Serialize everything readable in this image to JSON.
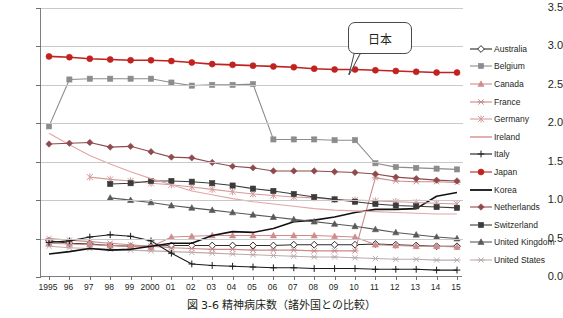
{
  "caption": "図 3-6  精神病床数（諸外国との比較）",
  "annotation": {
    "label": "日本"
  },
  "axis": {
    "y_ticks": [
      "0.0",
      "0.5",
      "1.0",
      "1.5",
      "2.0",
      "2.5",
      "3.0",
      "3.5"
    ],
    "x_ticks": [
      "1995",
      "96",
      "97",
      "98",
      "99",
      "2000",
      "01",
      "02",
      "03",
      "04",
      "05",
      "06",
      "07",
      "08",
      "09",
      "10",
      "11",
      "12",
      "13",
      "14",
      "15"
    ]
  },
  "legend": {
    "position": "right",
    "items": [
      {
        "label": "Australia",
        "color": "#2b2b2b",
        "marker": "diamond-open",
        "fill": "#ffffff"
      },
      {
        "label": "Belgium",
        "color": "#8c8c8c",
        "marker": "square",
        "fill": "#8c8c8c"
      },
      {
        "label": "Canada",
        "color": "#d08c8c",
        "marker": "triangle",
        "fill": "#d08c8c"
      },
      {
        "label": "France",
        "color": "#c98b8b",
        "marker": "x-bar",
        "fill": "#c98b8b"
      },
      {
        "label": "Germany",
        "color": "#d59a9a",
        "marker": "asterisk",
        "fill": "#d59a9a"
      },
      {
        "label": "Ireland",
        "color": "#e0a7a7",
        "marker": "none",
        "fill": "#e0a7a7"
      },
      {
        "label": "Italy",
        "color": "#1a1a1a",
        "marker": "plus",
        "fill": "#1a1a1a"
      },
      {
        "label": "Japan",
        "color": "#c0221f",
        "marker": "circle",
        "fill": "#c0221f"
      },
      {
        "label": "Korea",
        "color": "#111111",
        "marker": "none",
        "fill": "#111111"
      },
      {
        "label": "Netherlands",
        "color": "#8e4a4f",
        "marker": "diamond",
        "fill": "#8e4a4f"
      },
      {
        "label": "Switzerland",
        "color": "#3b3b3b",
        "marker": "square",
        "fill": "#3b3b3b"
      },
      {
        "label": "United Kingdom",
        "color": "#595959",
        "marker": "triangle",
        "fill": "#595959"
      },
      {
        "label": "United States",
        "color": "#bdaaaa",
        "marker": "x-bar",
        "fill": "#bdaaaa"
      }
    ]
  },
  "chart_data": {
    "type": "line",
    "title": "図 3-6  精神病床数（諸外国との比較）",
    "xlabel": "",
    "ylabel": "",
    "ylim": [
      0.0,
      3.5
    ],
    "grid": true,
    "legend_position": "right",
    "annotations": [
      {
        "text": "日本",
        "series": "Japan",
        "x": "09"
      }
    ],
    "x": [
      "1995",
      "96",
      "97",
      "98",
      "99",
      "2000",
      "01",
      "02",
      "03",
      "04",
      "05",
      "06",
      "07",
      "08",
      "09",
      "10",
      "11",
      "12",
      "13",
      "14",
      "15"
    ],
    "series": [
      {
        "name": "Japan",
        "color": "#c0221f",
        "values": [
          2.87,
          2.86,
          2.84,
          2.83,
          2.82,
          2.82,
          2.81,
          2.79,
          2.77,
          2.76,
          2.75,
          2.74,
          2.73,
          2.71,
          2.7,
          2.7,
          2.69,
          2.68,
          2.67,
          2.66,
          2.66
        ]
      },
      {
        "name": "Belgium",
        "color": "#8c8c8c",
        "values": [
          1.96,
          2.57,
          2.58,
          2.58,
          2.58,
          2.58,
          2.53,
          2.49,
          2.5,
          2.5,
          2.51,
          1.79,
          1.79,
          1.79,
          1.78,
          1.78,
          1.48,
          1.43,
          1.42,
          1.41,
          1.4
        ]
      },
      {
        "name": "Netherlands",
        "color": "#8e4a4f",
        "values": [
          1.73,
          1.74,
          1.75,
          1.69,
          1.7,
          1.63,
          1.56,
          1.55,
          1.49,
          1.44,
          1.42,
          1.38,
          1.38,
          1.38,
          1.37,
          1.36,
          1.34,
          1.3,
          1.28,
          1.26,
          1.25
        ]
      },
      {
        "name": "Ireland",
        "color": "#e0a7a7",
        "values": [
          1.87,
          1.72,
          1.58,
          1.47,
          1.37,
          1.28,
          1.2,
          1.12,
          1.07,
          1.02,
          0.98,
          0.95,
          0.92,
          0.89,
          0.87,
          0.86,
          0.85,
          0.84,
          0.83,
          0.82,
          0.82
        ]
      },
      {
        "name": "Switzerland",
        "color": "#3b3b3b",
        "values": [
          null,
          null,
          null,
          1.21,
          1.22,
          1.25,
          1.25,
          1.24,
          1.22,
          1.19,
          1.15,
          1.12,
          1.08,
          1.04,
          1.01,
          0.98,
          0.95,
          0.93,
          0.92,
          0.91,
          0.9
        ]
      },
      {
        "name": "Germany",
        "color": "#d59a9a",
        "values": [
          null,
          null,
          1.3,
          1.27,
          1.25,
          1.22,
          1.2,
          1.17,
          1.14,
          1.11,
          1.08,
          1.06,
          1.04,
          1.03,
          1.01,
          1.0,
          0.99,
          0.98,
          0.97,
          0.96,
          0.95
        ]
      },
      {
        "name": "United Kingdom",
        "color": "#595959",
        "values": [
          null,
          null,
          null,
          1.03,
          1.0,
          0.97,
          0.93,
          0.9,
          0.87,
          0.84,
          0.81,
          0.78,
          0.75,
          0.72,
          0.69,
          0.66,
          0.62,
          0.58,
          0.55,
          0.52,
          0.5
        ]
      },
      {
        "name": "Korea",
        "color": "#111111",
        "values": [
          0.3,
          0.33,
          0.37,
          0.35,
          0.36,
          0.4,
          0.44,
          0.44,
          0.54,
          0.59,
          0.58,
          0.63,
          0.72,
          0.74,
          0.78,
          0.84,
          0.88,
          0.88,
          0.89,
          1.05,
          1.1
        ]
      },
      {
        "name": "Italy",
        "color": "#1a1a1a",
        "values": [
          0.45,
          0.47,
          0.52,
          0.55,
          0.53,
          0.47,
          0.31,
          0.17,
          0.15,
          0.14,
          0.13,
          0.12,
          0.12,
          0.11,
          0.11,
          0.11,
          0.1,
          0.1,
          0.1,
          0.09,
          0.09
        ]
      },
      {
        "name": "Canada",
        "color": "#d08c8c",
        "values": [
          0.44,
          0.43,
          0.42,
          0.41,
          0.4,
          0.39,
          0.52,
          0.53,
          0.54,
          0.54,
          0.54,
          0.54,
          0.54,
          0.54,
          0.53,
          0.52,
          0.42,
          0.41,
          0.4,
          0.4,
          0.39
        ]
      },
      {
        "name": "Australia",
        "color": "#2b2b2b",
        "values": [
          0.47,
          0.44,
          0.43,
          0.41,
          0.4,
          0.4,
          0.41,
          0.41,
          0.41,
          0.41,
          0.41,
          0.41,
          0.42,
          0.42,
          0.42,
          0.42,
          0.43,
          0.42,
          0.41,
          0.4,
          0.4
        ]
      },
      {
        "name": "France",
        "color": "#c98b8b",
        "values": [
          0.5,
          0.48,
          0.46,
          0.44,
          0.42,
          0.4,
          0.38,
          0.37,
          0.36,
          0.36,
          0.35,
          0.35,
          0.35,
          0.34,
          0.34,
          0.34,
          1.29,
          1.25,
          1.24,
          1.24,
          1.23
        ]
      },
      {
        "name": "United States",
        "color": "#bdaaaa",
        "values": [
          0.4,
          0.38,
          0.37,
          0.36,
          0.35,
          0.34,
          0.33,
          0.32,
          0.31,
          0.3,
          0.29,
          0.28,
          0.27,
          0.26,
          0.26,
          0.25,
          0.24,
          0.23,
          0.23,
          0.22,
          0.22
        ]
      }
    ]
  }
}
